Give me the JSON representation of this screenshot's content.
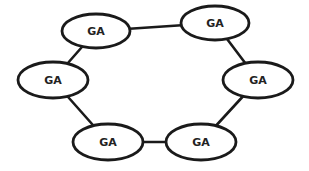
{
  "diagram": {
    "type": "ring-topology",
    "colors": {
      "stroke": "#1a1a1a",
      "fill": "#ffffff",
      "text": "#222222"
    },
    "nodes": [
      {
        "id": "n1",
        "label": "GA",
        "cx": 96,
        "cy": 31,
        "rx": 34,
        "ry": 17
      },
      {
        "id": "n2",
        "label": "GA",
        "cx": 215,
        "cy": 23,
        "rx": 34,
        "ry": 17
      },
      {
        "id": "n3",
        "label": "GA",
        "cx": 258,
        "cy": 80,
        "rx": 35,
        "ry": 18
      },
      {
        "id": "n4",
        "label": "GA",
        "cx": 201,
        "cy": 142,
        "rx": 35,
        "ry": 18
      },
      {
        "id": "n5",
        "label": "GA",
        "cx": 108,
        "cy": 142,
        "rx": 35,
        "ry": 18
      },
      {
        "id": "n6",
        "label": "GA",
        "cx": 53,
        "cy": 80,
        "rx": 35,
        "ry": 18
      }
    ],
    "edges": [
      {
        "from": "n1",
        "to": "n2"
      },
      {
        "from": "n2",
        "to": "n3"
      },
      {
        "from": "n3",
        "to": "n4"
      },
      {
        "from": "n4",
        "to": "n5"
      },
      {
        "from": "n5",
        "to": "n6"
      },
      {
        "from": "n6",
        "to": "n1"
      }
    ]
  }
}
